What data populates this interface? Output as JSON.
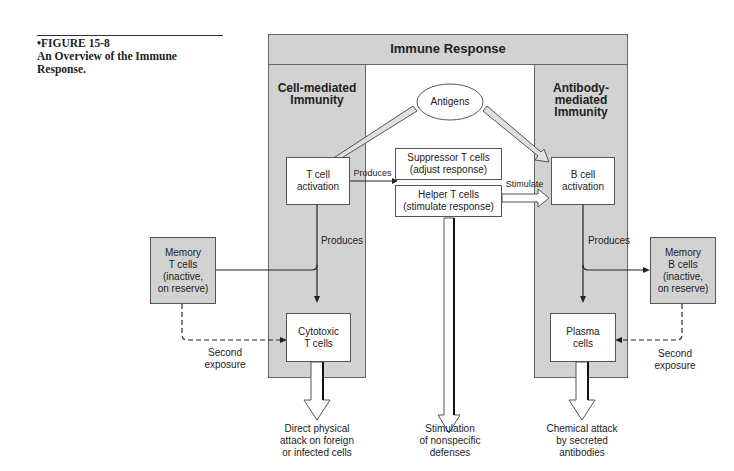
{
  "caption": {
    "figure_number": "•FIGURE 15-8",
    "title": "An Overview of the Immune\nResponse."
  },
  "diagram": {
    "title": "Immune Response",
    "left_column": "Cell-mediated\nImmunity",
    "right_column": "Antibody-\nmediated\nImmunity",
    "antigens": "Antigens",
    "t_cell_activation": "T cell\nactivation",
    "b_cell_activation": "B cell\nactivation",
    "suppressor": "Suppressor T cells\n(adjust response)",
    "helper": "Helper T cells\n(stimulate response)",
    "produces_right_arrow": "Produces",
    "stimulate": "Stimulate",
    "produces_left": "Produces",
    "produces_right": "Produces",
    "memory_t": "Memory\nT cells\n(inactive,\non reserve)",
    "memory_b": "Memory\nB cells\n(inactive,\non reserve)",
    "cytotoxic": "Cytotoxic\nT cells",
    "plasma": "Plasma\ncells",
    "second_exposure_left": "Second\nexposure",
    "second_exposure_right": "Second\nexposure",
    "outcome_left": "Direct physical\nattack on foreign\nor infected cells",
    "outcome_center": "Stimulation\nof nonspecific\ndefenses",
    "outcome_right": "Chemical attack\nby secreted\nantibodies"
  }
}
